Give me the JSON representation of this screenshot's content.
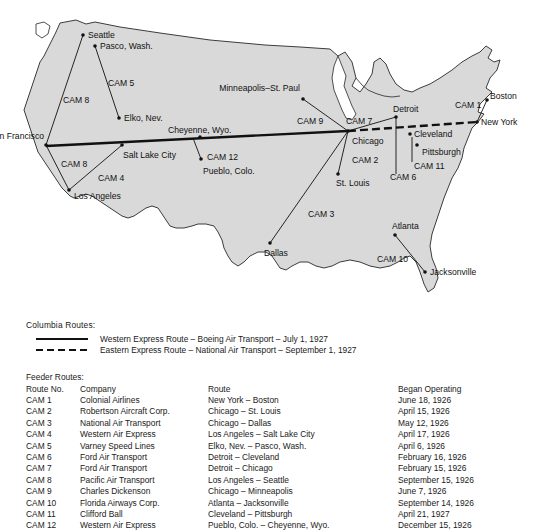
{
  "map": {
    "fill_color": "#d9d9d9",
    "outline_color": "#3c3c3c",
    "line_color": "#111111",
    "cities": [
      {
        "name": "Seattle",
        "x": 83,
        "y": 35,
        "lx": 88,
        "ly": 38,
        "anchor": "start"
      },
      {
        "name": "Pasco, Wash.",
        "x": 95,
        "y": 46,
        "lx": 100,
        "ly": 49,
        "anchor": "start"
      },
      {
        "name": "Elko, Nev.",
        "x": 119,
        "y": 118,
        "lx": 124,
        "ly": 121,
        "anchor": "start"
      },
      {
        "name": "San Francisco",
        "x": 46,
        "y": 145,
        "lx": 44,
        "ly": 139,
        "anchor": "end"
      },
      {
        "name": "Los Angeles",
        "x": 69,
        "y": 190,
        "lx": 74,
        "ly": 199,
        "anchor": "start"
      },
      {
        "name": "Salt Lake City",
        "x": 122,
        "y": 145,
        "lx": 123,
        "ly": 158,
        "anchor": "start"
      },
      {
        "name": "Cheyenne, Wyo.",
        "x": 200,
        "y": 137,
        "lx": 168,
        "ly": 133,
        "anchor": "start"
      },
      {
        "name": "Pueblo, Colo.",
        "x": 201,
        "y": 159,
        "lx": 203,
        "ly": 174,
        "anchor": "start"
      },
      {
        "name": "Minneapolis–St. Paul",
        "x": 303,
        "y": 99,
        "lx": 300,
        "ly": 91,
        "anchor": "end"
      },
      {
        "name": "Chicago",
        "x": 348,
        "y": 131,
        "lx": 352,
        "ly": 144,
        "anchor": "start"
      },
      {
        "name": "St. Louis",
        "x": 338,
        "y": 174,
        "lx": 336,
        "ly": 186,
        "anchor": "start"
      },
      {
        "name": "Dallas",
        "x": 270,
        "y": 243,
        "lx": 264,
        "ly": 256,
        "anchor": "start"
      },
      {
        "name": "Detroit",
        "x": 396,
        "y": 117,
        "lx": 393,
        "ly": 112,
        "anchor": "start"
      },
      {
        "name": "Cleveland",
        "x": 410,
        "y": 134,
        "lx": 414,
        "ly": 137,
        "anchor": "start"
      },
      {
        "name": "Pittsburgh",
        "x": 417,
        "y": 145,
        "lx": 422,
        "ly": 155,
        "anchor": "start"
      },
      {
        "name": "New York",
        "x": 477,
        "y": 122,
        "lx": 481,
        "ly": 125,
        "anchor": "start"
      },
      {
        "name": "Boston",
        "x": 487,
        "y": 100,
        "lx": 490,
        "ly": 99,
        "anchor": "start"
      },
      {
        "name": "Atlanta",
        "x": 395,
        "y": 235,
        "lx": 392,
        "ly": 229,
        "anchor": "start"
      },
      {
        "name": "Jacksonville",
        "x": 425,
        "y": 272,
        "lx": 430,
        "ly": 275,
        "anchor": "start"
      }
    ],
    "cam_labels": [
      {
        "text": "CAM 8",
        "x": 63,
        "y": 103
      },
      {
        "text": "CAM 5",
        "x": 108,
        "y": 86
      },
      {
        "text": "CAM 8",
        "x": 61,
        "y": 167
      },
      {
        "text": "CAM 4",
        "x": 98,
        "y": 181
      },
      {
        "text": "CAM 12",
        "x": 207,
        "y": 160
      },
      {
        "text": "CAM 9",
        "x": 297,
        "y": 124
      },
      {
        "text": "CAM 7",
        "x": 346,
        "y": 124
      },
      {
        "text": "CAM 2",
        "x": 352,
        "y": 163
      },
      {
        "text": "CAM 3",
        "x": 308,
        "y": 217
      },
      {
        "text": "CAM 6",
        "x": 390,
        "y": 180
      },
      {
        "text": "CAM 11",
        "x": 414,
        "y": 169
      },
      {
        "text": "CAM 1",
        "x": 455,
        "y": 108
      },
      {
        "text": "CAM 10",
        "x": 377,
        "y": 262
      }
    ],
    "feeder_lines": [
      {
        "name": "cam8-seattle-sf",
        "x1": 83,
        "y1": 35,
        "x2": 46,
        "y2": 145
      },
      {
        "name": "cam5-pasco-elko",
        "x1": 95,
        "y1": 46,
        "x2": 119,
        "y2": 118
      },
      {
        "name": "cam8-sf-la",
        "x1": 46,
        "y1": 145,
        "x2": 69,
        "y2": 190
      },
      {
        "name": "cam4-la-slc",
        "x1": 69,
        "y1": 190,
        "x2": 122,
        "y2": 145
      },
      {
        "name": "cam12-chey-pueblo",
        "x1": 193,
        "y1": 138,
        "x2": 201,
        "y2": 159
      },
      {
        "name": "cam9-mpls-chi",
        "x1": 303,
        "y1": 99,
        "x2": 348,
        "y2": 131
      },
      {
        "name": "cam7-det-chi",
        "x1": 396,
        "y1": 117,
        "x2": 348,
        "y2": 131
      },
      {
        "name": "cam2-chi-stl",
        "x1": 348,
        "y1": 131,
        "x2": 338,
        "y2": 174
      },
      {
        "name": "cam3-chi-dallas",
        "x1": 348,
        "y1": 131,
        "x2": 270,
        "y2": 243
      },
      {
        "name": "cam6-det-cleve",
        "x1": 396,
        "y1": 117,
        "x2": 396,
        "y2": 174
      },
      {
        "name": "cam11-cleve-pitt",
        "x1": 412,
        "y1": 137,
        "x2": 412,
        "y2": 162
      },
      {
        "name": "cam1-ny-boston",
        "x1": 477,
        "y1": 122,
        "x2": 487,
        "y2": 100
      },
      {
        "name": "cam10-atl-jax",
        "x1": 395,
        "y1": 235,
        "x2": 425,
        "y2": 272
      }
    ],
    "trunk_lines": [
      {
        "name": "western-express",
        "style": "solid",
        "x1": 46,
        "y1": 146,
        "x2": 348,
        "y2": 131
      },
      {
        "name": "eastern-express",
        "style": "dashed",
        "x1": 348,
        "y1": 131,
        "x2": 477,
        "y2": 122
      }
    ]
  },
  "legend": {
    "title": "Columbia Routes:",
    "entries": [
      {
        "style": "solid",
        "text": "Western Express Route – Boeing Air Transport – July 1, 1927"
      },
      {
        "style": "dashed",
        "text": "Eastern Express Route – National Air Transport – September 1, 1927"
      }
    ]
  },
  "feeder_table": {
    "title": "Feeder Routes:",
    "headers": [
      "Route No.",
      "Company",
      "Route",
      "Began Operating"
    ],
    "rows": [
      {
        "no": "CAM 1",
        "company": "Colonial Airlines",
        "route": "New York – Boston",
        "began": "June 18, 1926"
      },
      {
        "no": "CAM 2",
        "company": "Robertson Aircraft Corp.",
        "route": "Chicago – St. Louis",
        "began": "April 15, 1926"
      },
      {
        "no": "CAM 3",
        "company": "National Air Transport",
        "route": "Chicago – Dallas",
        "began": "May 12, 1926"
      },
      {
        "no": "CAM 4",
        "company": "Western Air Express",
        "route": "Los Angeles – Salt Lake City",
        "began": "April 17, 1926"
      },
      {
        "no": "CAM 5",
        "company": "Varney Speed Lines",
        "route": "Elko, Nev. – Pasco, Wash.",
        "began": "April 6, 1926"
      },
      {
        "no": "CAM 6",
        "company": "Ford Air Transport",
        "route": "Detroit – Cleveland",
        "began": "February 16, 1926"
      },
      {
        "no": "CAM 7",
        "company": "Ford Air Transport",
        "route": "Detroit – Chicago",
        "began": "February 15, 1926"
      },
      {
        "no": "CAM 8",
        "company": "Pacific Air Transport",
        "route": "Los Angeles – Seattle",
        "began": "September 15, 1926"
      },
      {
        "no": "CAM 9",
        "company": "Charles Dickenson",
        "route": "Chicago – Minneapolis",
        "began": "June 7, 1926"
      },
      {
        "no": "CAM 10",
        "company": "Florida Airways Corp.",
        "route": "Atlanta – Jacksonville",
        "began": "September 14, 1926"
      },
      {
        "no": "CAM 11",
        "company": "Clifford Ball",
        "route": "Cleveland – Pittsburgh",
        "began": "April 21, 1927"
      },
      {
        "no": "CAM 12",
        "company": "Western Air Express",
        "route": "Pueblo, Colo. – Cheyenne, Wyo.",
        "began": "December 15, 1926"
      }
    ]
  }
}
